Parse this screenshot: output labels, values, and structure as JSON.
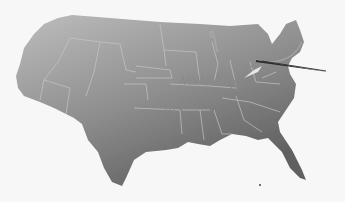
{
  "image": {
    "subject": "stylized gray map of the contiguous United States with a needle and thread stitching across the middle",
    "colors": {
      "background": "#f7f7f7",
      "map_light": "#b8b8b8",
      "map_dark": "#6a6a6a",
      "border_lines": "#c4c4c4",
      "thread": "#9a9a9a",
      "needle": "#2a2a2a"
    }
  }
}
